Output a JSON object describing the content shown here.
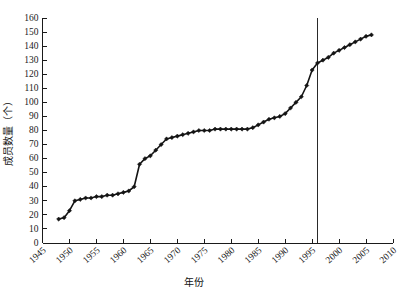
{
  "chart_data": {
    "type": "line",
    "title": "",
    "xlabel": "年份",
    "ylabel": "成员数量（个）",
    "xlim": [
      1945,
      2010
    ],
    "ylim": [
      0,
      160
    ],
    "xticks": [
      1945,
      1950,
      1955,
      1960,
      1965,
      1970,
      1975,
      1980,
      1985,
      1990,
      1995,
      2000,
      2005,
      2010
    ],
    "xtick_labels": [
      "1945",
      "1950",
      "1955",
      "1960",
      "1965",
      "1970",
      "1975",
      "1980",
      "1985",
      "1990",
      "1995",
      "2000",
      "2005",
      "2010"
    ],
    "yticks": [
      0,
      10,
      20,
      30,
      40,
      50,
      60,
      70,
      80,
      90,
      100,
      110,
      120,
      130,
      140,
      150,
      160
    ],
    "ytick_labels": [
      "0",
      "10",
      "20",
      "30",
      "40",
      "50",
      "60",
      "70",
      "80",
      "90",
      "100",
      "110",
      "120",
      "130",
      "140",
      "150",
      "160"
    ],
    "grid": false,
    "legend": false,
    "marker": "diamond",
    "line_color": "#141414",
    "series": [
      {
        "name": "成员数量",
        "x": [
          1948,
          1949,
          1950,
          1951,
          1952,
          1953,
          1954,
          1955,
          1956,
          1957,
          1958,
          1959,
          1960,
          1961,
          1962,
          1963,
          1964,
          1965,
          1966,
          1967,
          1968,
          1969,
          1970,
          1971,
          1972,
          1973,
          1974,
          1975,
          1976,
          1977,
          1978,
          1979,
          1980,
          1981,
          1982,
          1983,
          1984,
          1985,
          1986,
          1987,
          1988,
          1989,
          1990,
          1991,
          1992,
          1993,
          1994,
          1995,
          1996,
          1997,
          1998,
          1999,
          2000,
          2001,
          2002,
          2003,
          2004,
          2005,
          2006
        ],
        "values": [
          17,
          18,
          23,
          30,
          31,
          32,
          32,
          33,
          33,
          34,
          34,
          35,
          36,
          37,
          40,
          56,
          60,
          62,
          66,
          70,
          74,
          75,
          76,
          77,
          78,
          79,
          80,
          80,
          80,
          81,
          81,
          81,
          81,
          81,
          81,
          81,
          82,
          84,
          86,
          88,
          89,
          90,
          92,
          96,
          100,
          104,
          112,
          123,
          128,
          130,
          132,
          135,
          137,
          139,
          141,
          143,
          145,
          147,
          148
        ]
      }
    ],
    "annotations": [
      {
        "type": "vertical-line",
        "x": 1996,
        "y_from": 0,
        "y_to": 160,
        "color": "#2a2a2a"
      }
    ]
  }
}
